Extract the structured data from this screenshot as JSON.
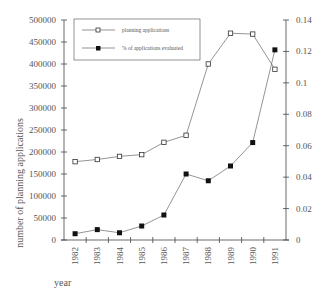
{
  "chart_data": {
    "type": "line",
    "title": "",
    "xlabel": "year",
    "ylabel": "number of planning applications",
    "y2label": "",
    "categories": [
      "1982",
      "1983",
      "1984",
      "1985",
      "1986",
      "1987",
      "1988",
      "1989",
      "1990",
      "1991"
    ],
    "ylim": [
      0,
      500000
    ],
    "y_ticks": [
      "0",
      "50000",
      "100000",
      "150000",
      "200000",
      "250000",
      "300000",
      "350000",
      "400000",
      "450000",
      "500000"
    ],
    "y2lim": [
      0,
      0.14
    ],
    "y2_ticks": [
      "0",
      "0.02",
      "0.04",
      "0.06",
      "0.08",
      "0.1",
      "0.12",
      "0.14"
    ],
    "grid": false,
    "legend_position": "top-left",
    "series": [
      {
        "name": "planning applications",
        "axis": "left",
        "marker": "open-square",
        "values": [
          178000,
          183000,
          190000,
          194000,
          222000,
          238000,
          400000,
          470000,
          468000,
          388000
        ]
      },
      {
        "name": "% of applications evaluated",
        "axis": "right",
        "marker": "filled-square",
        "values": [
          0.004,
          0.0066,
          0.0046,
          0.0089,
          0.0159,
          0.042,
          0.0377,
          0.0471,
          0.062,
          0.121
        ]
      }
    ]
  }
}
